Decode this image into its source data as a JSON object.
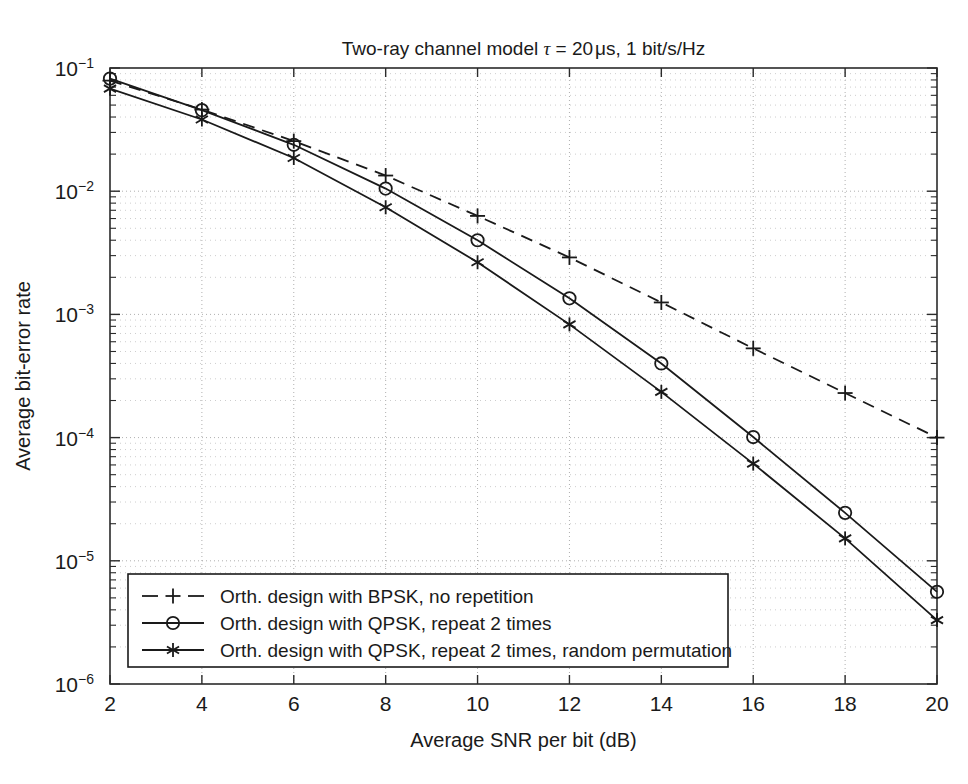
{
  "chart_data": {
    "type": "line",
    "title_parts": {
      "prefix": "Two-ray channel model ",
      "tau": "τ",
      "equals": " = 20",
      "unit": "μs",
      "suffix": ", 1 bit/s/Hz"
    },
    "xlabel": "Average SNR per bit (dB)",
    "ylabel": "Average bit-error rate",
    "xlim": [
      2,
      20
    ],
    "ylim": [
      1e-06,
      0.1
    ],
    "yscale": "log",
    "xscale": "linear",
    "grid": true,
    "grid_style": "dotted",
    "legend_position": "lower-left",
    "x_ticks": [
      2,
      4,
      6,
      8,
      10,
      12,
      14,
      16,
      18,
      20
    ],
    "x_tick_labels": [
      "2",
      "4",
      "6",
      "8",
      "10",
      "12",
      "14",
      "16",
      "18",
      "20"
    ],
    "y_ticks": [
      0.1,
      0.01,
      0.001,
      0.0001,
      1e-05,
      1e-06
    ],
    "y_tick_labels": [
      {
        "mantissa": "10",
        "exponent": "−1"
      },
      {
        "mantissa": "10",
        "exponent": "−2"
      },
      {
        "mantissa": "10",
        "exponent": "−3"
      },
      {
        "mantissa": "10",
        "exponent": "−4"
      },
      {
        "mantissa": "10",
        "exponent": "−5"
      },
      {
        "mantissa": "10",
        "exponent": "−6"
      }
    ],
    "x": [
      2,
      4,
      6,
      8,
      10,
      12,
      14,
      16,
      18,
      20
    ],
    "series": [
      {
        "name": "Orth. design with BPSK, no repetition",
        "marker": "plus",
        "linestyle": "dashed",
        "color": "#1a1a1a",
        "values": [
          0.079,
          0.046,
          0.0255,
          0.0134,
          0.0063,
          0.0029,
          0.00125,
          0.00053,
          0.00023,
          0.0001
        ]
      },
      {
        "name": "Orth. design with QPSK, repeat 2 times",
        "marker": "circle",
        "linestyle": "solid",
        "color": "#1a1a1a",
        "values": [
          0.082,
          0.0455,
          0.0238,
          0.0105,
          0.004,
          0.00135,
          0.0004,
          0.000101,
          2.45e-05,
          5.6e-06
        ]
      },
      {
        "name": "Orth. design with QPSK, repeat 2 times, random permutation",
        "marker": "asterisk",
        "linestyle": "solid",
        "color": "#1a1a1a",
        "values": [
          0.068,
          0.0382,
          0.0186,
          0.0074,
          0.00265,
          0.00083,
          0.000235,
          6.15e-05,
          1.52e-05,
          3.3e-06
        ]
      }
    ]
  },
  "legend": {
    "items": [
      {
        "label": "Orth. design with BPSK, no repetition",
        "marker": "plus",
        "linestyle": "dashed"
      },
      {
        "label": "Orth. design with QPSK, repeat 2 times",
        "marker": "circle",
        "linestyle": "solid"
      },
      {
        "label": "Orth. design with QPSK, repeat 2 times, random permutation",
        "marker": "asterisk",
        "linestyle": "solid"
      }
    ]
  },
  "colors": {
    "foreground": "#1a1a1a",
    "background": "#ffffff",
    "grid": "#9a9a9a"
  }
}
